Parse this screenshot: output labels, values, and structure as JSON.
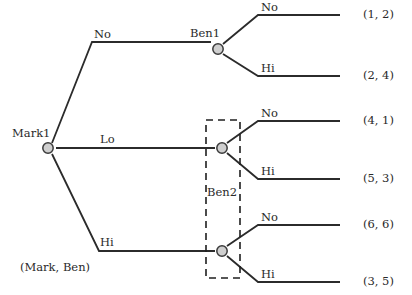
{
  "diagram": {
    "title_caption": "(Mark, Ben)",
    "nodes": [
      {
        "id": "mark1",
        "label": "Mark1",
        "x": 48,
        "y": 148
      },
      {
        "id": "ben1",
        "label": "Ben1",
        "x": 218,
        "y": 49
      },
      {
        "id": "ben2a",
        "label": "",
        "x": 222,
        "y": 148
      },
      {
        "id": "ben2b",
        "label": "",
        "x": 222,
        "y": 251
      }
    ],
    "information_set": {
      "label": "Ben2",
      "x": 206,
      "y": 120,
      "width": 34,
      "height": 158
    },
    "actions": {
      "mark_no": "No",
      "mark_lo": "Lo",
      "mark_hi": "Hi",
      "ben1_no": "No",
      "ben1_hi": "Hi",
      "ben2a_no": "No",
      "ben2a_hi": "Hi",
      "ben2b_no": "No",
      "ben2b_hi": "Hi"
    },
    "payoffs": [
      {
        "id": "p1",
        "text": "(1, 2)",
        "x": 365,
        "y": 18
      },
      {
        "id": "p2",
        "text": "(2, 4)",
        "x": 365,
        "y": 74
      },
      {
        "id": "p3",
        "text": "(4, 1)",
        "x": 365,
        "y": 124
      },
      {
        "id": "p4",
        "text": "(5, 3)",
        "x": 365,
        "y": 177
      },
      {
        "id": "p5",
        "text": "(6, 6)",
        "x": 365,
        "y": 228
      },
      {
        "id": "p6",
        "text": "(3, 5)",
        "x": 365,
        "y": 281
      }
    ],
    "colors": {
      "line": "#2b2b2b",
      "node_fill": "#cfcfcf",
      "node_stroke": "#3a3a3a",
      "text": "#2a2a2a",
      "dash": "#1f1f1f",
      "background": "#ffffff"
    }
  }
}
